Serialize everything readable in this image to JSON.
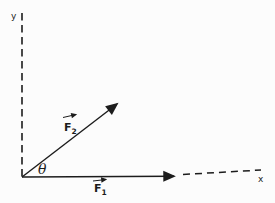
{
  "figure": {
    "background_color": "#fcfcfc",
    "ink_color": "#1c1c1c",
    "axes": {
      "y_label": "y",
      "x_label": "x"
    },
    "angle_label": "θ",
    "vectors": {
      "f1": {
        "letter": "F",
        "subscript": "1"
      },
      "f2": {
        "letter": "F",
        "subscript": "2"
      }
    }
  }
}
